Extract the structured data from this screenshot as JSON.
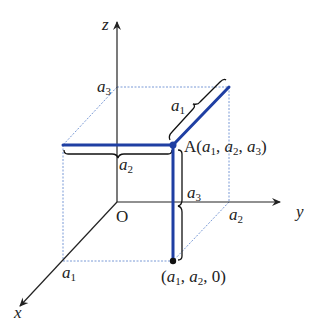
{
  "diagram": {
    "axes": {
      "x_label": "x",
      "y_label": "y",
      "z_label": "z",
      "origin_label": "O"
    },
    "ticks": {
      "a1": {
        "base": "a",
        "sub": "1"
      },
      "a2": {
        "base": "a",
        "sub": "2"
      },
      "a3": {
        "base": "a",
        "sub": "3"
      }
    },
    "point_A": {
      "name": "A",
      "open": "(",
      "sep1": ", ",
      "sep2": ", ",
      "close": ")"
    },
    "point_proj": {
      "open": "(",
      "sep1": ", ",
      "sep2": ", ",
      "tail": "0)"
    },
    "colors": {
      "axis": "#222222",
      "box_edge": "#7a9ad6",
      "path_highlight": "#1f3fa3",
      "brace": "#111111"
    }
  }
}
